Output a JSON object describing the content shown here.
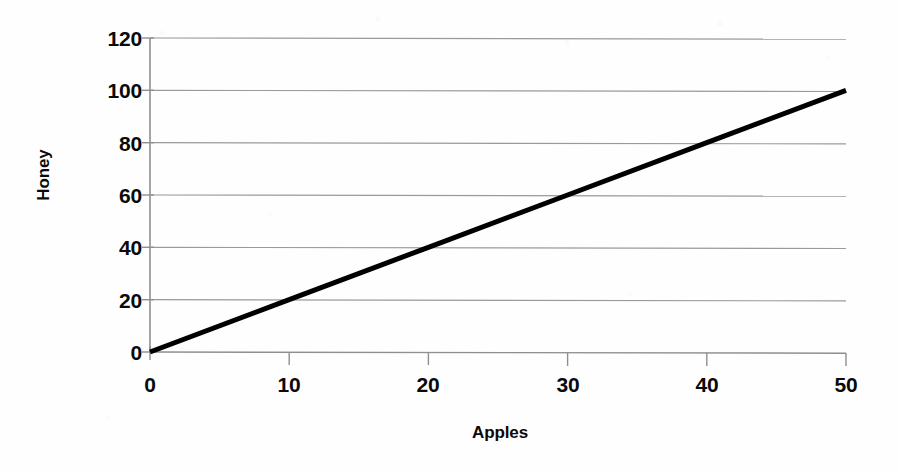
{
  "chart_data": {
    "type": "line",
    "title": "",
    "subtitle": "",
    "xlabel": "Apples",
    "ylabel": "Honey",
    "xlim": [
      0,
      50
    ],
    "ylim": [
      0,
      120
    ],
    "grid": true,
    "grid_axis": "y",
    "legend": false,
    "legend_position": "none",
    "annotations": [],
    "xticks": [
      0,
      10,
      20,
      30,
      40,
      50
    ],
    "xtick_labels": [
      "0",
      "10",
      "20",
      "30",
      "40",
      "50"
    ],
    "yticks": [
      0,
      20,
      40,
      60,
      80,
      100,
      120
    ],
    "ytick_labels": [
      "0",
      "20",
      "40",
      "60",
      "80",
      "100",
      "120"
    ],
    "series": [
      {
        "name": "Honey vs Apples",
        "x": [
          0,
          10,
          20,
          30,
          40,
          50
        ],
        "values": [
          0,
          20,
          40,
          60,
          80,
          100
        ],
        "color": "#000000",
        "line_width": 5,
        "markers": false
      }
    ]
  },
  "style": {
    "background": "#ffffff",
    "grid_color": "#9a9a9a",
    "axis_color": "#8f8f8f",
    "tick_color": "#8f8f8f",
    "text_color": "#0a0a0a",
    "series_color": "#000000"
  },
  "geometry": {
    "plot_left": 150,
    "plot_right": 846,
    "plot_top": 38,
    "plot_bottom": 352
  }
}
